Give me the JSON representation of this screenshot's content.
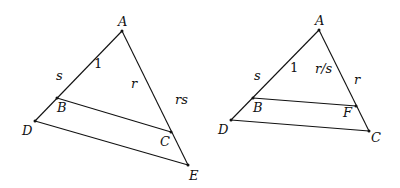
{
  "figures": [
    {
      "name": "left-figure",
      "points": {
        "A": [
          122,
          31
        ],
        "B": [
          57,
          98
        ],
        "D": [
          35,
          121
        ],
        "C": [
          171,
          132
        ],
        "E": [
          188,
          165
        ]
      },
      "segments": [
        [
          "A",
          "D"
        ],
        [
          "A",
          "E"
        ],
        [
          "B",
          "C"
        ],
        [
          "D",
          "E"
        ]
      ],
      "labels": {
        "A": "A",
        "B": "B",
        "C": "C",
        "D": "D",
        "E": "E",
        "seg_AB": "1",
        "seg_BD": "s",
        "seg_AC": "r",
        "seg_AE": "rs"
      }
    },
    {
      "name": "right-figure",
      "points": {
        "A": [
          319,
          30
        ],
        "B": [
          253,
          98
        ],
        "D": [
          231,
          120
        ],
        "F": [
          356,
          106
        ],
        "C": [
          369,
          131
        ]
      },
      "segments": [
        [
          "A",
          "D"
        ],
        [
          "A",
          "C"
        ],
        [
          "B",
          "F"
        ],
        [
          "D",
          "C"
        ]
      ],
      "labels": {
        "A": "A",
        "B": "B",
        "C": "C",
        "D": "D",
        "F": "F",
        "seg_AB": "1",
        "seg_BD": "s",
        "seg_AF": "r/s",
        "seg_AC": "r"
      }
    }
  ]
}
